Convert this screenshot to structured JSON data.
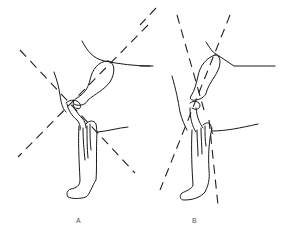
{
  "figure": {
    "type": "anatomical line drawing",
    "panels": [
      {
        "id": "A",
        "label": "A"
      },
      {
        "id": "B",
        "label": "B"
      }
    ],
    "colors": {
      "line": "#1a1a1a",
      "background": "#ffffff",
      "label": "#555555"
    }
  }
}
